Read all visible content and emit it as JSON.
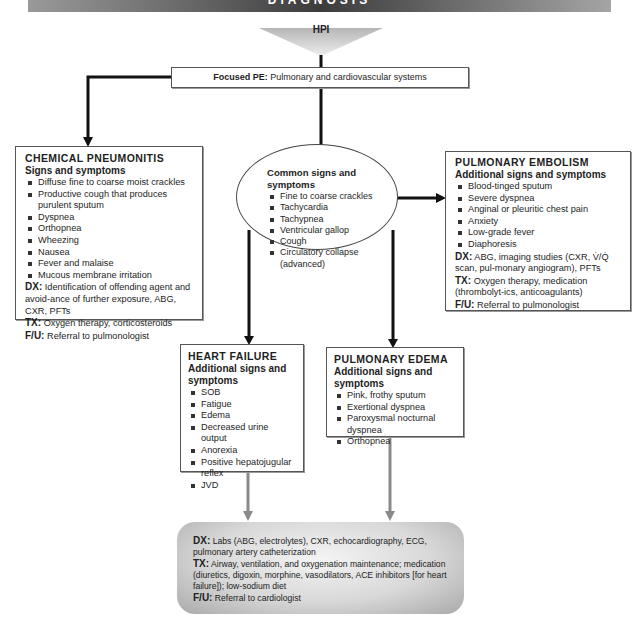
{
  "header": {
    "title": "DIAGNOSIS"
  },
  "colors": {
    "line_dark": "#111111",
    "line_gray": "#8a8a8a",
    "box_border": "#555555"
  },
  "hpi": {
    "label": "HPI"
  },
  "focused_pe": {
    "label": "Focused PE:",
    "text": "Pulmonary and cardiovascular systems"
  },
  "common": {
    "title": "Common signs and symptoms",
    "items": [
      "Fine to coarse crackles",
      "Tachycardia",
      "Tachypnea",
      "Ventricular gallop",
      "Cough",
      "Circulatory collapse (advanced)"
    ]
  },
  "chemical_pneumonitis": {
    "title": "CHEMICAL PNEUMONITIS",
    "subtitle": "Signs and symptoms",
    "items": [
      "Diffuse fine to coarse moist crackles",
      "Productive cough that produces purulent sputum",
      "Dyspnea",
      "Orthopnea",
      "Wheezing",
      "Nausea",
      "Fever and malaise",
      "Mucous membrane irritation"
    ],
    "dx_label": "DX:",
    "dx": "Identification of offending agent and avoid-ance of further exposure, ABG, CXR, PFTs",
    "tx_label": "TX:",
    "tx": "Oxygen therapy, corticosteroids",
    "fu_label": "F/U:",
    "fu": "Referral to pulmonologist"
  },
  "pulmonary_embolism": {
    "title": "PULMONARY EMBOLISM",
    "subtitle": "Additional signs and symptoms",
    "items": [
      "Blood-tinged sputum",
      "Severe dyspnea",
      "Anginal or pleuritic chest pain",
      "Anxiety",
      "Low-grade fever",
      "Diaphoresis"
    ],
    "dx_label": "DX:",
    "dx": "ABG, imaging studies (CXR, V̇/Q̇ scan, pul-monary angiogram), PFTs",
    "tx_label": "TX:",
    "tx": "Oxygen therapy, medication (thrombolyt-ics, anticoagulants)",
    "fu_label": "F/U:",
    "fu": "Referral to pulmonologist"
  },
  "heart_failure": {
    "title": "HEART FAILURE",
    "subtitle": "Additional signs and symptoms",
    "items": [
      "SOB",
      "Fatigue",
      "Edema",
      "Decreased urine output",
      "Anorexia",
      "Positive hepatojugular reflex",
      "JVD"
    ]
  },
  "pulmonary_edema": {
    "title": "PULMONARY EDEMA",
    "subtitle": "Additional signs and symptoms",
    "items": [
      "Pink, frothy sputum",
      "Exertional dyspnea",
      "Paroxysmal nocturnal dyspnea",
      "Orthopnea"
    ]
  },
  "final": {
    "dx_label": "DX:",
    "dx": "Labs (ABG, electrolytes), CXR, echocardiography, ECG, pulmonary artery catheterization",
    "tx_label": "TX:",
    "tx": "Airway, ventilation, and oxygenation maintenance; medication (diuretics, digoxin, morphine, vasodilators, ACE inhibitors [for heart failure]); low-sodium diet",
    "fu_label": "F/U:",
    "fu": "Referral to cardiologist"
  }
}
